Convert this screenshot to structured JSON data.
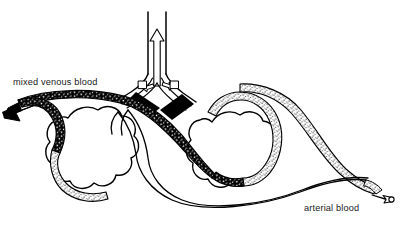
{
  "figure": {
    "type": "line-art anatomical diagram",
    "background_color": "#ffffff",
    "ink_color": "#000000",
    "labels": {
      "venous": "mixed venous blood",
      "arterial": "arterial blood"
    },
    "parts": {
      "trachea": "trachea",
      "bronchus_left": "left bronchus",
      "bronchus_right": "right bronchus",
      "alveolus_left": "left alveolus",
      "alveolus_right": "right alveolus",
      "capillary_deoxygenated": "deoxygenated capillary",
      "capillary_oxygenated": "oxygenated capillary",
      "pulmonary_vein": "pulmonary vein"
    },
    "arrows": {
      "expired_air": "expired air arrow (up, hollow)",
      "inspired_air_left": "inspired air arrow (down-left, hollow)",
      "inspired_air_right": "inspired air arrow (down-right, hollow)",
      "venous_inflow": "mixed venous blood inflow arrow (solid, pointing left)",
      "arterial_outflow": "arterial blood outflow arrow (hollow, pointing right)"
    },
    "fill_styles": {
      "deoxygenated": "solid black with white speckles",
      "oxygenated": "light stipple dots on white"
    }
  }
}
